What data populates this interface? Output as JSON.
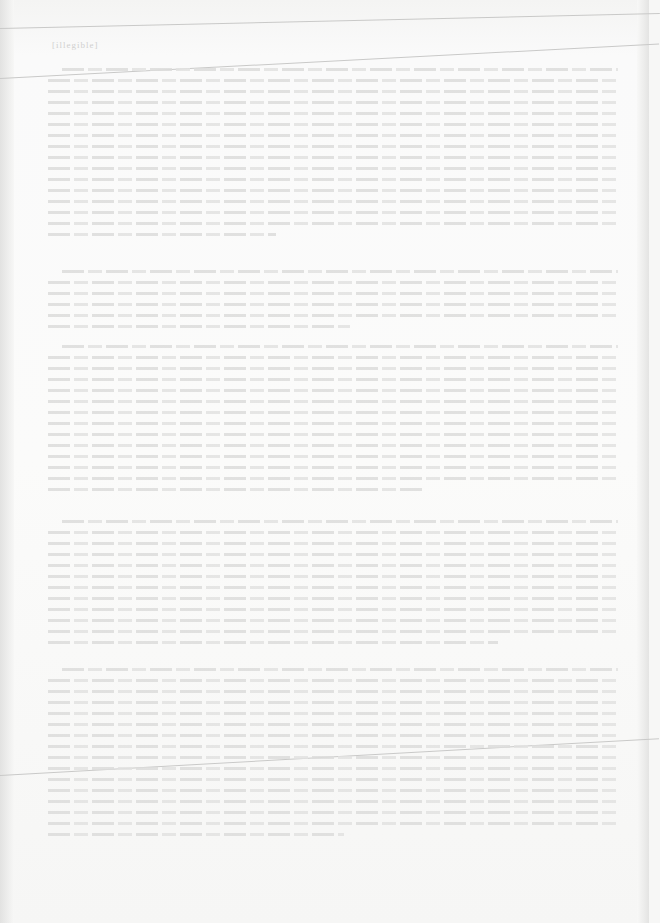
{
  "document": {
    "type": "scanned printed page",
    "legibility": "illegible (severely faded scan)",
    "header": {
      "text": "[illegible]"
    },
    "paragraphs": [
      {
        "top": 68,
        "lines": 16,
        "text": "[illegible]"
      },
      {
        "top": 270,
        "lines": 6,
        "text": "[illegible]"
      },
      {
        "top": 345,
        "lines": 14,
        "text": "[illegible]"
      },
      {
        "top": 520,
        "lines": 12,
        "text": "[illegible]"
      },
      {
        "top": 668,
        "lines": 16,
        "text": "[illegible]"
      }
    ]
  }
}
